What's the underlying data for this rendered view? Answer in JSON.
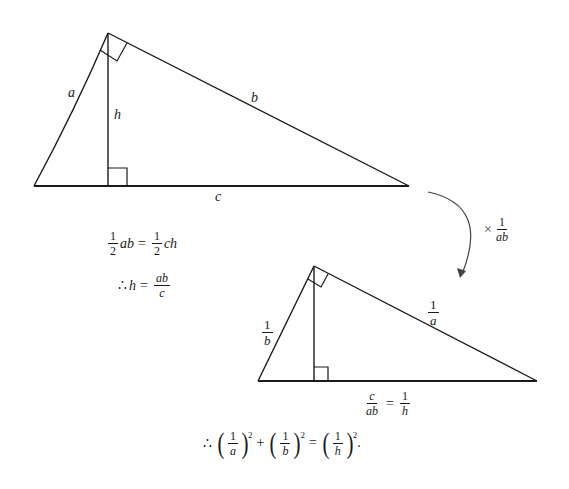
{
  "diagram": {
    "triangle_original": {
      "vertices": {
        "left": [
          34,
          186
        ],
        "apex": [
          108,
          33
        ],
        "right": [
          409,
          186
        ],
        "foot": [
          108,
          186
        ]
      },
      "labels": {
        "a": "a",
        "b": "b",
        "c": "c",
        "h": "h"
      }
    },
    "area_equation": {
      "lhs_num": "1",
      "lhs_den": "2",
      "lhs_var": "ab",
      "eq": "=",
      "rhs_num": "1",
      "rhs_den": "2",
      "rhs_var": "ch"
    },
    "therefore_equation": {
      "therefore": "∴",
      "var": "h",
      "eq": "=",
      "num": "ab",
      "den": "c"
    },
    "transform_arrow": {
      "times": "×",
      "num": "1",
      "den": "ab"
    },
    "triangle_scaled": {
      "vertices": {
        "left": [
          258,
          381
        ],
        "apex": [
          314,
          266
        ],
        "right": [
          537,
          381
        ],
        "foot": [
          314,
          381
        ]
      },
      "labels": {
        "left_side": {
          "num": "1",
          "den": "b"
        },
        "right_side": {
          "num": "1",
          "den": "a"
        },
        "base": {
          "num": "c",
          "den": "ab",
          "eq": "=",
          "num2": "1",
          "den2": "h"
        }
      }
    },
    "final_equation": {
      "therefore": "∴",
      "term1": {
        "num": "1",
        "den": "a",
        "exp": "2"
      },
      "plus": "+",
      "term2": {
        "num": "1",
        "den": "b",
        "exp": "2"
      },
      "eq": "=",
      "term3": {
        "num": "1",
        "den": "h",
        "exp": "2"
      },
      "period": "."
    }
  }
}
